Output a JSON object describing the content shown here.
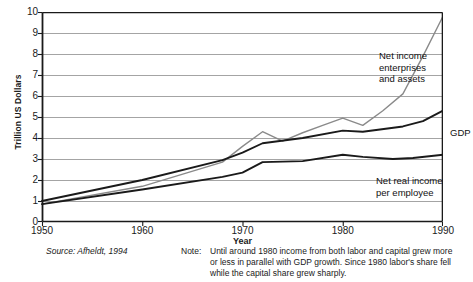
{
  "chart_data": {
    "type": "line",
    "title": "",
    "xlabel": "Year",
    "ylabel": "Trillion US Dollars",
    "xlim": [
      1950,
      1990
    ],
    "ylim": [
      0,
      10
    ],
    "grid": true,
    "legend_position": "inline-annotations",
    "x_ticks": [
      "1950",
      "1960",
      "1970",
      "1980",
      "1990"
    ],
    "y_ticks": [
      "0",
      "1",
      "2",
      "3",
      "4",
      "5",
      "6",
      "7",
      "8",
      "9",
      "10"
    ],
    "series": [
      {
        "name": "Net income enterprises and assets",
        "color": "#8a8a8a",
        "label_text": "Net income\nenterprises\nand assets",
        "x": [
          1950,
          1960,
          1968,
          1970,
          1972,
          1974,
          1976,
          1978,
          1980,
          1982,
          1984,
          1986,
          1988,
          1990
        ],
        "values": [
          0.85,
          1.7,
          2.85,
          3.6,
          4.3,
          3.85,
          4.25,
          4.6,
          4.95,
          4.6,
          5.3,
          6.1,
          7.9,
          9.8
        ]
      },
      {
        "name": "GDP",
        "color": "#1a1a1a",
        "label_text": "GDP",
        "x": [
          1950,
          1960,
          1968,
          1970,
          1972,
          1976,
          1980,
          1982,
          1986,
          1988,
          1990
        ],
        "values": [
          1.0,
          2.0,
          2.95,
          3.3,
          3.75,
          4.0,
          4.35,
          4.3,
          4.55,
          4.8,
          5.3
        ]
      },
      {
        "name": "Net real income per employee",
        "color": "#1a1a1a",
        "label_text": "Net real income\nper employee",
        "x": [
          1950,
          1960,
          1968,
          1970,
          1972,
          1976,
          1980,
          1982,
          1985,
          1987,
          1990
        ],
        "values": [
          0.85,
          1.55,
          2.15,
          2.35,
          2.85,
          2.9,
          3.2,
          3.1,
          3.0,
          3.05,
          3.2
        ]
      }
    ]
  },
  "axis": {
    "y_title": "Trillion US Dollars",
    "x_title": "Year"
  },
  "footer": {
    "source": "Source: Afheldt, 1994",
    "note_label": "Note:",
    "note_text": "Until around 1980 income from both labor and capital grew more or less in parallel with GDP growth. Since 1980 labor's share fell while the capital share grew sharply."
  }
}
